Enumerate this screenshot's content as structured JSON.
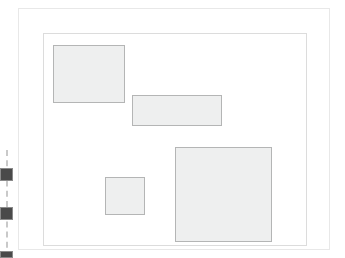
{
  "canvas": {
    "width": 345,
    "height": 258,
    "background_color": "#ffffff",
    "title": "Layout canvas"
  },
  "outer_frame": {
    "name": "page-border",
    "x": 18,
    "y": 8,
    "width": 312,
    "height": 242,
    "border_color": "#e8e8e8",
    "fill_color": "#ffffff"
  },
  "inner_frame": {
    "name": "content-area",
    "x": 43,
    "y": 33,
    "width": 264,
    "height": 213,
    "border_color": "#dcdcdc",
    "fill_color": "#ffffff"
  },
  "shapes": [
    {
      "id": "shape-1",
      "label": "rectangle-top-left",
      "x": 53,
      "y": 45,
      "width": 72,
      "height": 58,
      "fill_color": "#eeefef",
      "border_color": "#b4b5b5"
    },
    {
      "id": "shape-2",
      "label": "rectangle-wide-center",
      "x": 132,
      "y": 95,
      "width": 90,
      "height": 31,
      "fill_color": "#eeefef",
      "border_color": "#b4b5b5"
    },
    {
      "id": "shape-3",
      "label": "square-small-lower-left",
      "x": 105,
      "y": 177,
      "width": 40,
      "height": 38,
      "fill_color": "#eeefef",
      "border_color": "#b4b5b5"
    },
    {
      "id": "shape-4",
      "label": "square-large-lower-right",
      "x": 175,
      "y": 147,
      "width": 97,
      "height": 95,
      "fill_color": "#eeefef",
      "border_color": "#b4b5b5"
    }
  ],
  "guide_rail": {
    "label": "vertical-guide-rail",
    "line_color": "#c9c9c9",
    "line_style": "dashed",
    "handles": [
      {
        "id": "handle-1",
        "color": "#4a4a4a"
      },
      {
        "id": "handle-2",
        "color": "#4a4a4a"
      },
      {
        "id": "handle-3",
        "color": "#4a4a4a"
      }
    ]
  }
}
